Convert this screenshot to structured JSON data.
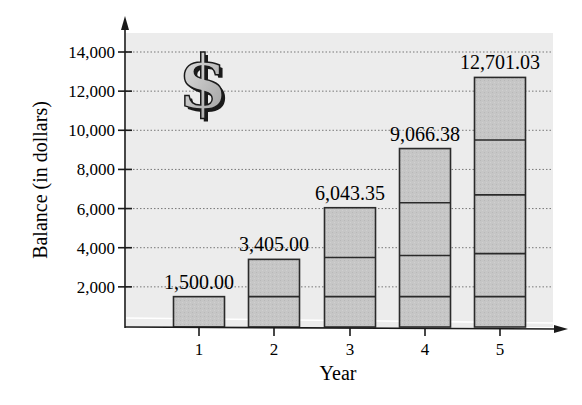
{
  "chart_data": {
    "type": "bar",
    "title": "",
    "xlabel": "Year",
    "ylabel": "Balance (in dollars)",
    "categories": [
      "1",
      "2",
      "3",
      "4",
      "5"
    ],
    "values": [
      1500.0,
      3405.0,
      6043.35,
      9066.38,
      12701.03
    ],
    "value_labels": [
      "1,500.00",
      "3,405.00",
      "6,043.35",
      "9,066.38",
      "12,701.03"
    ],
    "stacked_segment_boundaries": [
      [
        1500
      ],
      [
        1500,
        3405
      ],
      [
        1500,
        3500,
        6043.35
      ],
      [
        1500,
        3600,
        6300,
        9066.38
      ],
      [
        1500,
        3700,
        6700,
        9500,
        12701.03
      ]
    ],
    "yticks": [
      2000,
      4000,
      6000,
      8000,
      10000,
      12000,
      14000
    ],
    "ytick_labels": [
      "2,000",
      "4,000",
      "6,000",
      "8,000",
      "10,000",
      "12,000",
      "14,000"
    ],
    "ylim": [
      0,
      15000
    ],
    "grid": "horizontal dotted",
    "legend": null,
    "annotation_icon": "dollar-sign-icon",
    "colors": {
      "plot_background": "#ececec",
      "bar_fill": "#c4c4c4",
      "bar_stroke": "#2a2a2a",
      "grid": "#777777",
      "axis": "#1a1a1a"
    }
  }
}
